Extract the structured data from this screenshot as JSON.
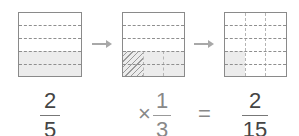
{
  "steps": [
    {
      "id": "box-1",
      "rows": 5,
      "cols": 1,
      "shaded_rows": 2,
      "description": "2/5 shaded"
    },
    {
      "id": "box-2",
      "rows": 5,
      "cols": 3,
      "shaded_rows": 2,
      "hatched_cols": 1,
      "description": "1/3 of 2/5 hatched"
    },
    {
      "id": "box-3",
      "rows": 5,
      "cols": 3,
      "shaded_cells": 2,
      "description": "2/15 shaded"
    }
  ],
  "equation": {
    "first": {
      "numerator": "2",
      "denominator": "5"
    },
    "times_symbol": "×",
    "second": {
      "numerator": "1",
      "denominator": "3"
    },
    "equals_symbol": "=",
    "result": {
      "numerator": "2",
      "denominator": "15"
    }
  },
  "colors": {
    "border": "#8a8a8a",
    "shade": "#ececec",
    "dash": "#8f8f8f",
    "arrow": "#a8a8a8"
  }
}
